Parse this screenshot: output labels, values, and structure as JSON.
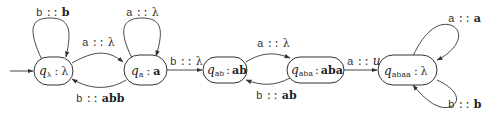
{
  "diagram": {
    "type": "subsequential transducer state diagram",
    "initial_state": "q_lambda",
    "states": [
      {
        "id": "q_lambda",
        "name": "q",
        "subscript": "λ",
        "output": "λ"
      },
      {
        "id": "q_a",
        "name": "q",
        "subscript": "a",
        "output": "a"
      },
      {
        "id": "q_ab",
        "name": "q",
        "subscript": "ab",
        "output": "ab"
      },
      {
        "id": "q_aba",
        "name": "q",
        "subscript": "aba",
        "output": "aba"
      },
      {
        "id": "q_abaa",
        "name": "q",
        "subscript": "abaa",
        "output": "λ"
      }
    ],
    "separator": ":",
    "transitions": [
      {
        "from": "q_lambda",
        "to": "q_lambda",
        "input": "b",
        "sep": "::",
        "output": "b"
      },
      {
        "from": "q_lambda",
        "to": "q_a",
        "input": "a",
        "sep": "::",
        "output": "λ"
      },
      {
        "from": "q_a",
        "to": "q_a",
        "input": "a",
        "sep": "::",
        "output": "λ"
      },
      {
        "from": "q_a",
        "to": "q_lambda",
        "input": "b",
        "sep": "::",
        "output": "abb"
      },
      {
        "from": "q_a",
        "to": "q_ab",
        "input": "b",
        "sep": "::",
        "output": "λ"
      },
      {
        "from": "q_ab",
        "to": "q_aba",
        "input": "a",
        "sep": "::",
        "output": "λ"
      },
      {
        "from": "q_aba",
        "to": "q_ab",
        "input": "b",
        "sep": "::",
        "output": "ab"
      },
      {
        "from": "q_aba",
        "to": "q_abaa",
        "input": "a",
        "sep": "::",
        "output": "u"
      },
      {
        "from": "q_abaa",
        "to": "q_abaa",
        "input": "a",
        "sep": "::",
        "output": "a"
      },
      {
        "from": "q_abaa",
        "to": "q_abaa",
        "input": "b",
        "sep": "::",
        "output": "b"
      }
    ]
  }
}
